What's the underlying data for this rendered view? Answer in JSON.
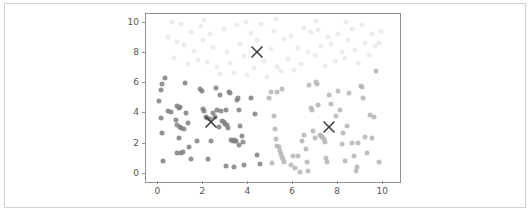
{
  "figure": {
    "width": 530,
    "height": 217,
    "background": "#ffffff",
    "border_color": "#cfcfcf"
  },
  "chart_data": {
    "type": "scatter",
    "title": "",
    "xlabel": "",
    "ylabel": "",
    "xlim": [
      -0.55,
      10.75
    ],
    "ylim": [
      -0.55,
      10.6
    ],
    "xticks": [
      0,
      2,
      4,
      6,
      8,
      10
    ],
    "yticks": [
      0,
      2,
      4,
      6,
      8,
      10
    ],
    "xticklabels": [
      "0",
      "2",
      "4",
      "6",
      "8",
      "10"
    ],
    "yticklabels": [
      "0",
      "2",
      "4",
      "6",
      "8",
      "10"
    ],
    "grid": false,
    "legend": null,
    "marker": "circle",
    "marker_size": 5,
    "axes_color": "#909090",
    "tick_label_color": "#555555",
    "series": [
      {
        "name": "cluster-0",
        "color": "#808080",
        "opacity": 0.85,
        "points": [
          [
            0.05,
            4.85
          ],
          [
            0.1,
            5.55
          ],
          [
            0.15,
            5.95
          ],
          [
            0.3,
            6.35
          ],
          [
            0.1,
            3.7
          ],
          [
            0.15,
            2.7
          ],
          [
            0.2,
            0.85
          ],
          [
            0.55,
            4.1
          ],
          [
            0.85,
            4.5
          ],
          [
            0.9,
            4.35
          ],
          [
            0.95,
            4.45
          ],
          [
            0.8,
            3.55
          ],
          [
            0.85,
            3.25
          ],
          [
            0.95,
            3.1
          ],
          [
            0.9,
            2.35
          ],
          [
            0.85,
            1.4
          ],
          [
            1.0,
            1.35
          ],
          [
            1.1,
            1.45
          ],
          [
            1.2,
            6.0
          ],
          [
            1.25,
            4.05
          ],
          [
            1.3,
            3.35
          ],
          [
            1.35,
            1.75
          ],
          [
            1.45,
            0.95
          ],
          [
            1.7,
            2.15
          ],
          [
            1.85,
            5.6
          ],
          [
            1.95,
            5.5
          ],
          [
            2.0,
            4.3
          ],
          [
            2.05,
            4.15
          ],
          [
            2.1,
            3.75
          ],
          [
            2.15,
            3.7
          ],
          [
            2.2,
            1.0
          ],
          [
            2.3,
            3.6
          ],
          [
            2.35,
            2.15
          ],
          [
            2.5,
            3.75
          ],
          [
            2.55,
            5.7
          ],
          [
            2.6,
            4.25
          ],
          [
            2.7,
            3.1
          ],
          [
            2.75,
            5.2
          ],
          [
            2.8,
            4.15
          ],
          [
            2.85,
            3.5
          ],
          [
            2.9,
            3.45
          ],
          [
            2.95,
            3.3
          ],
          [
            3.0,
            4.2
          ],
          [
            3.05,
            3.2
          ],
          [
            3.1,
            3.05
          ],
          [
            3.15,
            5.45
          ],
          [
            3.2,
            5.35
          ],
          [
            3.25,
            2.25
          ],
          [
            3.3,
            2.2
          ],
          [
            3.35,
            2.25
          ],
          [
            3.4,
            2.2
          ],
          [
            3.45,
            2.2
          ],
          [
            3.0,
            0.5
          ],
          [
            3.35,
            0.45
          ],
          [
            3.5,
            4.9
          ],
          [
            3.55,
            5.0
          ],
          [
            3.6,
            4.25
          ],
          [
            3.65,
            3.15
          ],
          [
            3.7,
            2.5
          ],
          [
            3.75,
            2.1
          ],
          [
            3.8,
            0.6
          ],
          [
            4.1,
            5.05
          ],
          [
            4.3,
            3.95
          ],
          [
            4.4,
            1.25
          ],
          [
            4.5,
            0.65
          ],
          [
            1.0,
            3.05
          ],
          [
            1.15,
            3.0
          ],
          [
            2.45,
            4.0
          ],
          [
            0.45,
            4.15
          ],
          [
            3.6,
            1.9
          ]
        ]
      },
      {
        "name": "cluster-1",
        "color": "#b5b5b5",
        "opacity": 0.85,
        "points": [
          [
            4.9,
            5.05
          ],
          [
            5.0,
            5.4
          ],
          [
            5.15,
            3.85
          ],
          [
            5.2,
            3.0
          ],
          [
            5.25,
            2.3
          ],
          [
            5.3,
            1.85
          ],
          [
            5.35,
            1.75
          ],
          [
            5.4,
            1.5
          ],
          [
            5.45,
            1.3
          ],
          [
            5.5,
            1.1
          ],
          [
            5.55,
            0.95
          ],
          [
            5.6,
            0.8
          ],
          [
            5.3,
            5.45
          ],
          [
            5.5,
            5.6
          ],
          [
            5.9,
            0.6
          ],
          [
            6.0,
            1.15
          ],
          [
            6.1,
            0.35
          ],
          [
            6.3,
            0.1
          ],
          [
            6.4,
            2.15
          ],
          [
            6.5,
            2.6
          ],
          [
            6.55,
            1.65
          ],
          [
            6.6,
            0.75
          ],
          [
            6.65,
            0.15
          ],
          [
            6.7,
            5.9
          ],
          [
            6.8,
            4.35
          ],
          [
            6.85,
            4.2
          ],
          [
            6.9,
            2.85
          ],
          [
            6.95,
            2.4
          ],
          [
            7.0,
            6.1
          ],
          [
            7.05,
            5.95
          ],
          [
            7.1,
            4.55
          ],
          [
            7.2,
            2.55
          ],
          [
            7.25,
            2.5
          ],
          [
            7.3,
            2.45
          ],
          [
            7.35,
            2.3
          ],
          [
            7.4,
            2.1
          ],
          [
            7.5,
            0.75
          ],
          [
            7.6,
            5.2
          ],
          [
            7.7,
            4.65
          ],
          [
            7.9,
            3.85
          ],
          [
            8.0,
            5.5
          ],
          [
            8.1,
            4.2
          ],
          [
            8.2,
            2.7
          ],
          [
            8.3,
            0.85
          ],
          [
            8.4,
            3.15
          ],
          [
            8.5,
            5.35
          ],
          [
            8.6,
            2.05
          ],
          [
            8.7,
            1.2
          ],
          [
            8.8,
            0.2
          ],
          [
            8.85,
            0.45
          ],
          [
            8.9,
            2.05
          ],
          [
            9.0,
            5.85
          ],
          [
            9.05,
            5.75
          ],
          [
            9.1,
            5.0
          ],
          [
            9.2,
            2.45
          ],
          [
            9.3,
            1.35
          ],
          [
            9.4,
            3.9
          ],
          [
            9.5,
            2.35
          ],
          [
            9.6,
            3.75
          ],
          [
            9.7,
            6.85
          ],
          [
            9.8,
            0.8
          ],
          [
            6.2,
            1.2
          ],
          [
            5.05,
            0.7
          ],
          [
            7.45,
            1.05
          ],
          [
            8.15,
            1.95
          ]
        ]
      },
      {
        "name": "cluster-2",
        "color": "#eaeaea",
        "opacity": 0.9,
        "points": [
          [
            0.45,
            9.1
          ],
          [
            0.7,
            7.65
          ],
          [
            0.85,
            8.75
          ],
          [
            1.0,
            9.95
          ],
          [
            1.15,
            8.55
          ],
          [
            1.3,
            7.25
          ],
          [
            1.45,
            9.4
          ],
          [
            1.6,
            8.15
          ],
          [
            1.75,
            7.55
          ],
          [
            1.9,
            9.8
          ],
          [
            2.0,
            8.9
          ],
          [
            2.15,
            7.4
          ],
          [
            2.3,
            9.25
          ],
          [
            2.45,
            8.4
          ],
          [
            2.6,
            7.1
          ],
          [
            2.75,
            6.6
          ],
          [
            2.9,
            9.6
          ],
          [
            3.05,
            8.05
          ],
          [
            3.2,
            7.35
          ],
          [
            3.35,
            6.7
          ],
          [
            3.5,
            9.9
          ],
          [
            3.65,
            8.6
          ],
          [
            3.8,
            7.8
          ],
          [
            3.95,
            6.55
          ],
          [
            4.1,
            9.35
          ],
          [
            4.25,
            7.0
          ],
          [
            4.4,
            8.85
          ],
          [
            4.55,
            9.95
          ],
          [
            4.7,
            7.45
          ],
          [
            4.85,
            6.45
          ],
          [
            5.0,
            8.25
          ],
          [
            5.15,
            9.5
          ],
          [
            5.3,
            7.1
          ],
          [
            5.45,
            6.8
          ],
          [
            5.6,
            8.95
          ],
          [
            5.75,
            7.6
          ],
          [
            5.9,
            9.15
          ],
          [
            6.05,
            6.9
          ],
          [
            6.2,
            8.35
          ],
          [
            6.35,
            7.25
          ],
          [
            6.5,
            9.7
          ],
          [
            6.65,
            8.05
          ],
          [
            6.8,
            9.4
          ],
          [
            6.95,
            7.85
          ],
          [
            7.1,
            9.55
          ],
          [
            7.25,
            8.45
          ],
          [
            7.4,
            7.15
          ],
          [
            7.55,
            9.05
          ],
          [
            7.7,
            8.6
          ],
          [
            7.85,
            7.5
          ],
          [
            8.0,
            9.25
          ],
          [
            8.15,
            8.1
          ],
          [
            8.3,
            7.7
          ],
          [
            8.45,
            8.9
          ],
          [
            8.6,
            9.6
          ],
          [
            8.75,
            8.2
          ],
          [
            8.9,
            7.35
          ],
          [
            9.05,
            9.85
          ],
          [
            9.2,
            8.7
          ],
          [
            9.35,
            7.9
          ],
          [
            9.5,
            9.3
          ],
          [
            9.65,
            8.5
          ],
          [
            9.8,
            8.65
          ],
          [
            0.6,
            10.1
          ],
          [
            2.05,
            10.2
          ],
          [
            3.9,
            10.1
          ],
          [
            5.25,
            10.25
          ],
          [
            7.0,
            10.15
          ],
          [
            8.35,
            10.1
          ],
          [
            9.9,
            9.5
          ]
        ]
      }
    ],
    "centroids": {
      "name": "cluster-centers",
      "marker": "x",
      "color": "#404040",
      "size": 13,
      "points": [
        [
          4.4,
          8.05
        ],
        [
          2.35,
          3.45
        ],
        [
          7.6,
          3.1
        ]
      ]
    }
  }
}
